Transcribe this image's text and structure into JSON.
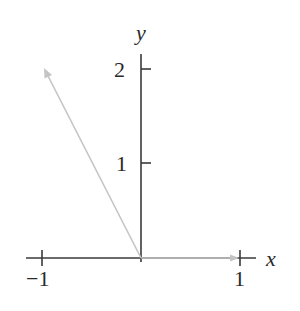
{
  "diagram": {
    "type": "vector-plot",
    "axes": {
      "x_label": "x",
      "y_label": "y",
      "x_ticks": [
        {
          "value": -1,
          "label": "−1"
        },
        {
          "value": 1,
          "label": "1"
        }
      ],
      "y_ticks": [
        {
          "value": 1,
          "label": "1"
        },
        {
          "value": 2,
          "label": "2"
        }
      ],
      "colors": {
        "axis": "#3a3a3a",
        "vector": "#c4c4c4"
      }
    },
    "vectors": [
      {
        "name": "v1",
        "from": [
          0,
          0
        ],
        "to": [
          -1,
          2
        ]
      },
      {
        "name": "v2",
        "from": [
          0,
          0
        ],
        "to": [
          1,
          0
        ]
      }
    ]
  }
}
